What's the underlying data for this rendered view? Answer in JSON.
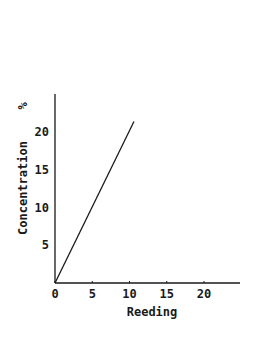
{
  "chart_data": {
    "type": "line",
    "title": "",
    "xlabel": "Reeding",
    "ylabel": "Concentration",
    "ylabel_unit": "%",
    "xlim": [
      0,
      25
    ],
    "ylim": [
      0,
      25
    ],
    "x_ticks": [
      0,
      5,
      10,
      15,
      20
    ],
    "y_ticks": [
      5,
      10,
      15,
      20
    ],
    "x_tick_labels": [
      "0",
      "5",
      "10",
      "15",
      "20"
    ],
    "y_tick_labels": [
      "5",
      "10",
      "15",
      "20"
    ],
    "grid": false,
    "legend": null,
    "series": [
      {
        "name": "calibration",
        "x": [
          0,
          10.6
        ],
        "y": [
          0,
          21.4
        ]
      }
    ]
  },
  "colors": {
    "ink": "#1a1a1a",
    "background": "#ffffff"
  }
}
